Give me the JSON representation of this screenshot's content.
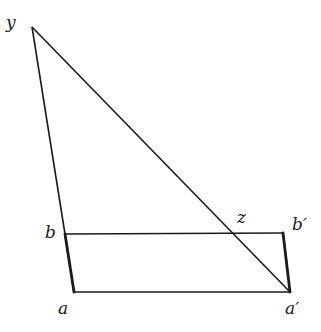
{
  "diagram": {
    "stroke_color": "#1a1a1a",
    "background": "#ffffff",
    "points": {
      "y": {
        "label": "y",
        "x": 32,
        "y": 27,
        "label_x": 6,
        "label_y": 14
      },
      "b": {
        "label": "b",
        "x": 65,
        "y": 234,
        "label_x": 45,
        "label_y": 224
      },
      "a": {
        "label": "a",
        "x": 74,
        "y": 292,
        "label_x": 58,
        "label_y": 300
      },
      "a_prime": {
        "label": "a′",
        "x": 290,
        "y": 292,
        "label_x": 285,
        "label_y": 300
      },
      "b_prime": {
        "label": "b′",
        "x": 283,
        "y": 233,
        "label_x": 292,
        "label_y": 216
      },
      "z": {
        "label": "z",
        "x": 231,
        "y": 234,
        "label_x": 237,
        "label_y": 209
      }
    },
    "segments": [
      {
        "from": "y",
        "to": "b",
        "weight": "thin"
      },
      {
        "from": "y",
        "to": "a_prime",
        "weight": "thin"
      },
      {
        "from": "b",
        "to": "b_prime",
        "weight": "thin"
      },
      {
        "from": "a",
        "to": "a_prime",
        "weight": "thin"
      },
      {
        "from": "b",
        "to": "a",
        "weight": "thick"
      },
      {
        "from": "b_prime",
        "to": "a_prime",
        "weight": "thick"
      }
    ]
  }
}
